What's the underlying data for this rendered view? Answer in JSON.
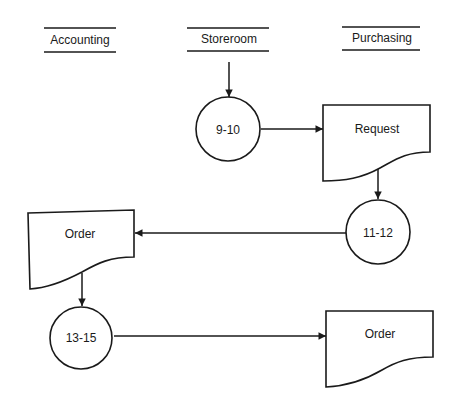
{
  "diagram": {
    "type": "flowchart",
    "columns": [
      {
        "id": "accounting",
        "label": "Accounting"
      },
      {
        "id": "storeroom",
        "label": "Storeroom"
      },
      {
        "id": "purchasing",
        "label": "Purchasing"
      }
    ],
    "nodes": [
      {
        "id": "proc-9-10",
        "shape": "circle",
        "label": "9-10"
      },
      {
        "id": "doc-request",
        "shape": "document",
        "label": "Request"
      },
      {
        "id": "proc-11-12",
        "shape": "circle",
        "label": "11-12"
      },
      {
        "id": "doc-order-1",
        "shape": "document",
        "label": "Order"
      },
      {
        "id": "proc-13-15",
        "shape": "circle",
        "label": "13-15"
      },
      {
        "id": "doc-order-2",
        "shape": "document",
        "label": "Order"
      }
    ],
    "edges": [
      {
        "from": "storeroom",
        "to": "proc-9-10"
      },
      {
        "from": "proc-9-10",
        "to": "doc-request"
      },
      {
        "from": "doc-request",
        "to": "proc-11-12"
      },
      {
        "from": "proc-11-12",
        "to": "doc-order-1"
      },
      {
        "from": "doc-order-1",
        "to": "proc-13-15"
      },
      {
        "from": "proc-13-15",
        "to": "doc-order-2"
      }
    ],
    "colors": {
      "line": "#1a1a1a",
      "background": "#ffffff"
    }
  }
}
